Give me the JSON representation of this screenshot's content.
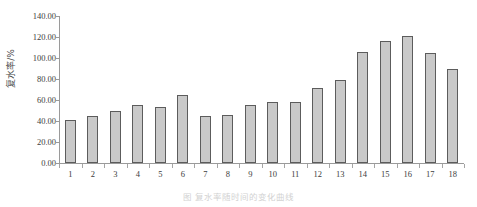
{
  "chart_data": {
    "type": "bar",
    "title": "",
    "subtitle": "",
    "xlabel": "",
    "ylabel": "复水率/%",
    "categories": [
      "1",
      "2",
      "3",
      "4",
      "5",
      "6",
      "7",
      "8",
      "9",
      "10",
      "11",
      "12",
      "13",
      "14",
      "15",
      "16",
      "17",
      "18"
    ],
    "values": [
      41.0,
      45.0,
      50.0,
      55.0,
      53.5,
      65.0,
      44.5,
      45.5,
      55.0,
      58.0,
      58.5,
      71.5,
      79.5,
      106.0,
      116.0,
      121.0,
      105.0,
      90.0
    ],
    "ylim": [
      0,
      140
    ],
    "ytick_labels": [
      "140.00",
      "120.00",
      "100.00",
      "80.00",
      "60.00",
      "40.00",
      "20.00",
      "0.00"
    ],
    "ytick_values": [
      140,
      120,
      100,
      80,
      60,
      40,
      20,
      0
    ],
    "grid": false,
    "legend": null,
    "legend_position": "none",
    "bar_fill_color": "#c9c9c9",
    "bar_edge_color": "#5c5c5c",
    "axis_color": "#9a9a9a",
    "text_color": "#3d3d3d"
  },
  "caption": {
    "text": "图  复水率随时间的变化曲线"
  }
}
